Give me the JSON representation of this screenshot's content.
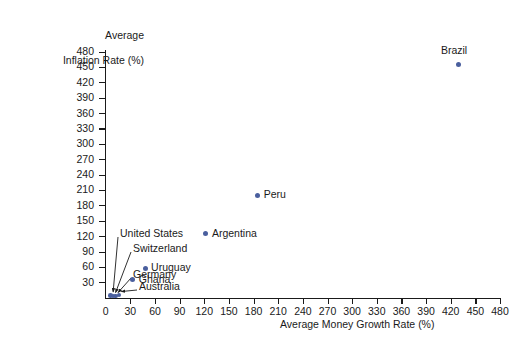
{
  "chart_data": {
    "type": "scatter",
    "title": "",
    "xlabel": "Average Money Growth Rate (%)",
    "ylabel": "Average Inflation Rate (%)",
    "ylabel_line1": "Average",
    "ylabel_line2": "Inflation Rate (%)",
    "xlim": [
      0,
      480
    ],
    "ylim": [
      0,
      480
    ],
    "xticks": [
      0,
      30,
      60,
      90,
      120,
      150,
      180,
      210,
      240,
      270,
      300,
      330,
      360,
      390,
      420,
      450,
      480
    ],
    "yticks": [
      30,
      60,
      90,
      120,
      150,
      180,
      210,
      240,
      270,
      300,
      330,
      360,
      390,
      420,
      450,
      480
    ],
    "grid": false,
    "legend": "none",
    "marker_color": "#4a5f9e",
    "axis_color": "#1a1a1a",
    "points": [
      {
        "name": "Brazil",
        "x": 430,
        "y": 455,
        "label_pos": "above"
      },
      {
        "name": "Peru",
        "x": 185,
        "y": 200,
        "label_pos": "right"
      },
      {
        "name": "Argentina",
        "x": 122,
        "y": 125,
        "label_pos": "right"
      },
      {
        "name": "Uruguay",
        "x": 48,
        "y": 57,
        "label_pos": "right"
      },
      {
        "name": "Ghana",
        "x": 33,
        "y": 35,
        "label_pos": "right"
      },
      {
        "name": "United States",
        "x": 6,
        "y": 4,
        "label_pos": "callout"
      },
      {
        "name": "Switzerland",
        "x": 9,
        "y": 3,
        "label_pos": "callout"
      },
      {
        "name": "Germany",
        "x": 12,
        "y": 3,
        "label_pos": "callout"
      },
      {
        "name": "Australia",
        "x": 16,
        "y": 5,
        "label_pos": "callout"
      }
    ],
    "callout_labels": [
      "United States",
      "Switzerland",
      "Germany",
      "Australia"
    ]
  }
}
